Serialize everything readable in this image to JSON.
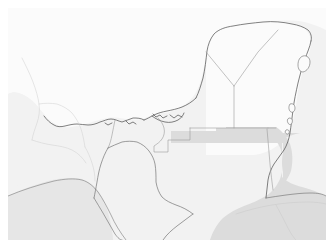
{
  "figure": {
    "kind": "reference-map",
    "width_px": 334,
    "height_px": 248,
    "margin_px": 8,
    "has_labels": false,
    "has_legend": false,
    "has_graticule": false
  },
  "colors": {
    "page_background": "#ffffff",
    "map_background": "#f2f2f2",
    "land_fill": "#fbfbfb",
    "highlight_fill": "#dcdcdc",
    "sea_fill": "#f2f2f2",
    "coastline_stroke": "#4a4a4a",
    "internal_border_stroke": "#9a9a9a",
    "faint_border_stroke": "#cfcfcf",
    "island_stroke": "#6b6b6b"
  },
  "strokes": {
    "coastline_width": 0.7,
    "internal_border_width": 0.6,
    "faint_border_width": 0.5
  },
  "geometry": {
    "map_background_rect": {
      "x": 8,
      "y": 8,
      "w": 318,
      "h": 232
    },
    "mainland_land": "M 8,8 L 326,8 L 326,240 L 8,240 Z",
    "sea_gulf": "M 8,98 C 20,96 34,104 44,112 C 56,122 62,132 70,140 C 80,150 86,160 92,170 C 80,176 66,182 54,186 C 40,190 24,194 8,196 Z",
    "sea_caribbean_south": "M 300,196 C 312,194 320,196 326,198 L 326,240 L 250,240 C 262,226 280,210 300,196 Z",
    "yucatan_peninsula_outline": "M 160,120 C 168,114 178,110 186,106 C 194,100 200,92 204,84 C 208,74 210,62 212,52 C 214,42 218,34 224,28 C 234,22 248,20 262,20 C 276,20 290,22 300,26 C 306,30 310,34 312,40 C 314,48 312,56 308,64 C 304,72 300,80 298,88 C 296,98 296,108 294,116 C 292,126 288,134 282,140 C 276,146 270,150 262,152",
    "highlight_guatemala": "M 170,140 C 182,140 196,140 210,140 L 228,140 L 228,134 L 248,134 L 268,134 L 268,160 C 268,172 266,182 262,190 C 252,194 240,196 228,198 C 214,200 200,204 190,210 C 182,216 176,224 172,232 L 166,240 L 240,240 L 240,206 C 250,200 262,196 272,192 C 282,188 290,182 296,174 L 296,140 L 268,140 Z",
    "highlight_belize": "M 268,112 C 274,116 278,122 280,130 C 282,140 282,150 280,160 C 278,170 274,178 268,184 L 268,112 Z",
    "cozumel_island": "M 300,60 C 304,58 308,60 310,64 C 312,70 310,76 306,80 C 302,82 298,80 296,76 C 294,70 296,64 300,60 Z",
    "bay_islands_small": "M 290,110 C 293,109 295,111 295,114 C 295,117 293,119 290,118 C 288,117 287,114 288,112 Z"
  },
  "regions": [
    {
      "id": "gulf-of-mexico",
      "role": "water",
      "shaded": false
    },
    {
      "id": "bay-of-campeche",
      "role": "water",
      "shaded": false
    },
    {
      "id": "caribbean-sea",
      "role": "water",
      "shaded": false
    },
    {
      "id": "mexico-mainland",
      "role": "land",
      "shaded": false
    },
    {
      "id": "yucatan-peninsula",
      "role": "land",
      "shaded": false
    },
    {
      "id": "southern-highlight-area",
      "role": "land",
      "shaded": true
    },
    {
      "id": "eastern-highlight-area",
      "role": "land",
      "shaded": true
    },
    {
      "id": "offshore-island",
      "role": "island",
      "shaded": false
    }
  ]
}
